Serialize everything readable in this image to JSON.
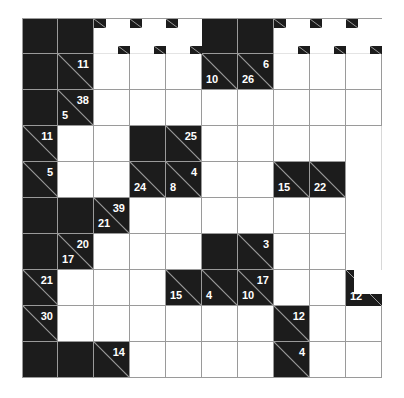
{
  "puzzle": {
    "type": "kakuro",
    "rows": 10,
    "cols": 10,
    "cell_size": 36,
    "colors": {
      "block": "#1c1c1c",
      "line": "#9a9a9a",
      "cell": "#ffffff",
      "clue_text": "#ffffff"
    },
    "grid": [
      [
        {
          "t": "B"
        },
        {
          "t": "B"
        },
        {
          "t": "G"
        },
        {
          "t": "G"
        },
        {
          "t": "G"
        },
        {
          "t": "B"
        },
        {
          "t": "B"
        },
        {
          "t": "G"
        },
        {
          "t": "G"
        },
        {
          "t": "G"
        }
      ],
      [
        {
          "t": "B"
        },
        {
          "t": "C",
          "r": "11"
        },
        {
          "t": "W"
        },
        {
          "t": "W"
        },
        {
          "t": "W"
        },
        {
          "t": "C",
          "d": "10"
        },
        {
          "t": "C",
          "d": "26",
          "r": "6"
        },
        {
          "t": "W"
        },
        {
          "t": "W"
        },
        {
          "t": "W"
        }
      ],
      [
        {
          "t": "B"
        },
        {
          "t": "C",
          "d": "5",
          "r": "38"
        },
        {
          "t": "W"
        },
        {
          "t": "W"
        },
        {
          "t": "W"
        },
        {
          "t": "W"
        },
        {
          "t": "W"
        },
        {
          "t": "W"
        },
        {
          "t": "W"
        },
        {
          "t": "W"
        }
      ],
      [
        {
          "t": "C",
          "r": "11"
        },
        {
          "t": "W"
        },
        {
          "t": "W"
        },
        {
          "t": "B"
        },
        {
          "t": "C",
          "r": "25"
        },
        {
          "t": "W"
        },
        {
          "t": "W"
        },
        {
          "t": "W"
        },
        {
          "t": "W"
        },
        {
          "t": "E"
        }
      ],
      [
        {
          "t": "C",
          "r": "5"
        },
        {
          "t": "W"
        },
        {
          "t": "W"
        },
        {
          "t": "C",
          "d": "24"
        },
        {
          "t": "C",
          "d": "8",
          "r": "4"
        },
        {
          "t": "W"
        },
        {
          "t": "W"
        },
        {
          "t": "C",
          "d": "15"
        },
        {
          "t": "C",
          "d": "22"
        },
        {
          "t": "E"
        }
      ],
      [
        {
          "t": "B"
        },
        {
          "t": "B"
        },
        {
          "t": "C",
          "d": "21",
          "r": "39"
        },
        {
          "t": "W"
        },
        {
          "t": "W"
        },
        {
          "t": "W"
        },
        {
          "t": "W"
        },
        {
          "t": "W"
        },
        {
          "t": "W"
        },
        {
          "t": "E"
        }
      ],
      [
        {
          "t": "B"
        },
        {
          "t": "C",
          "d": "17",
          "r": "20"
        },
        {
          "t": "W"
        },
        {
          "t": "W"
        },
        {
          "t": "W"
        },
        {
          "t": "B"
        },
        {
          "t": "C",
          "r": "3"
        },
        {
          "t": "W"
        },
        {
          "t": "W"
        },
        {
          "t": "E"
        }
      ],
      [
        {
          "t": "C",
          "r": "21"
        },
        {
          "t": "W"
        },
        {
          "t": "W"
        },
        {
          "t": "W"
        },
        {
          "t": "C",
          "d": "15"
        },
        {
          "t": "C",
          "d": "4"
        },
        {
          "t": "C",
          "d": "10",
          "r": "17"
        },
        {
          "t": "W"
        },
        {
          "t": "W"
        },
        {
          "t": "P",
          "d": "12"
        }
      ],
      [
        {
          "t": "C",
          "r": "30"
        },
        {
          "t": "W"
        },
        {
          "t": "W"
        },
        {
          "t": "W"
        },
        {
          "t": "W"
        },
        {
          "t": "W"
        },
        {
          "t": "W"
        },
        {
          "t": "C",
          "r": "12"
        },
        {
          "t": "W"
        },
        {
          "t": "W"
        }
      ],
      [
        {
          "t": "B"
        },
        {
          "t": "B"
        },
        {
          "t": "C",
          "r": "14"
        },
        {
          "t": "W"
        },
        {
          "t": "W"
        },
        {
          "t": "W"
        },
        {
          "t": "W"
        },
        {
          "t": "C",
          "r": "4"
        },
        {
          "t": "W"
        },
        {
          "t": "W"
        }
      ]
    ]
  }
}
